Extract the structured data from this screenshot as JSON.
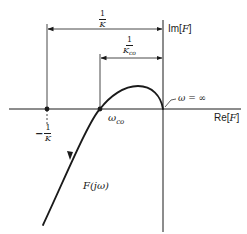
{
  "figure": {
    "axes": {
      "real_label_prefix": "Re[",
      "real_label_var": "F",
      "real_label_suffix": "]",
      "imag_label_prefix": "Im[",
      "imag_label_var": "F",
      "imag_label_suffix": "]"
    },
    "dimension_1_over_K": {
      "numerator": "1",
      "denominator": "K"
    },
    "dimension_1_over_Kco": {
      "numerator": "1",
      "denominator": "K",
      "denominator_sub": "co"
    },
    "point_minus_1_over_K": {
      "sign": "−",
      "numerator": "1",
      "denominator": "K"
    },
    "point_omega_co": {
      "symbol": "ω",
      "sub": "co"
    },
    "point_omega_inf": {
      "label": "ω = ∞"
    },
    "curve_label": "F(jω)",
    "colors": {
      "ink": "#1a1a1a",
      "background": "#ffffff"
    }
  }
}
